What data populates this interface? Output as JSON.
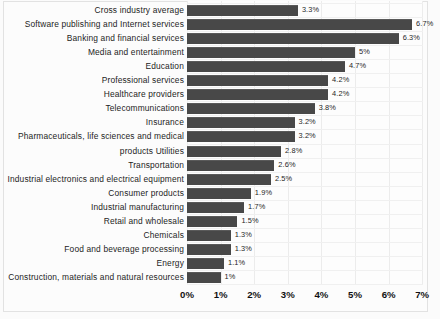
{
  "chart_data": {
    "type": "bar",
    "orientation": "horizontal",
    "title": "",
    "xlabel": "",
    "ylabel": "",
    "xlim": [
      0,
      7
    ],
    "grid": true,
    "legend": null,
    "value_suffix": "%",
    "tick_labels": [
      "0%",
      "1%",
      "2%",
      "3%",
      "4%",
      "5%",
      "6%",
      "7%"
    ],
    "tick_values": [
      0,
      1,
      2,
      3,
      4,
      5,
      6,
      7
    ],
    "bar_color": "#484848",
    "categories": [
      "Cross industry average",
      "Software publishing and Internet services",
      "Banking and financial services",
      "Media and  entertainment",
      "Education",
      "Professional services",
      "Healthcare providers",
      "Telecommunications",
      "Insurance",
      "Pharmaceuticals, life sciences and medical",
      "products Utilities",
      "Transportation",
      "Industrial electronics and electrical equipment",
      "Consumer products",
      "Industrial manufacturing",
      "Retail and wholesale",
      "Chemicals",
      "Food and beverage processing",
      "Energy",
      "Construction, materials and natural resources"
    ],
    "values": [
      3.3,
      6.7,
      6.3,
      5,
      4.7,
      4.2,
      4.2,
      3.8,
      3.2,
      3.2,
      2.8,
      2.6,
      2.5,
      1.9,
      1.7,
      1.5,
      1.3,
      1.3,
      1.1,
      1
    ],
    "value_labels": [
      "3.3%",
      "6.7%",
      "6.3%",
      "5%",
      "4.7%",
      "4.2%",
      "4.2%",
      "3.8%",
      "3.2%",
      "3.2%",
      "2.8%",
      "2.6%",
      "2.5%",
      "1.9%",
      "1.7%",
      "1.5%",
      "1.3%",
      "1.3%",
      "1.1%",
      "1%"
    ]
  }
}
